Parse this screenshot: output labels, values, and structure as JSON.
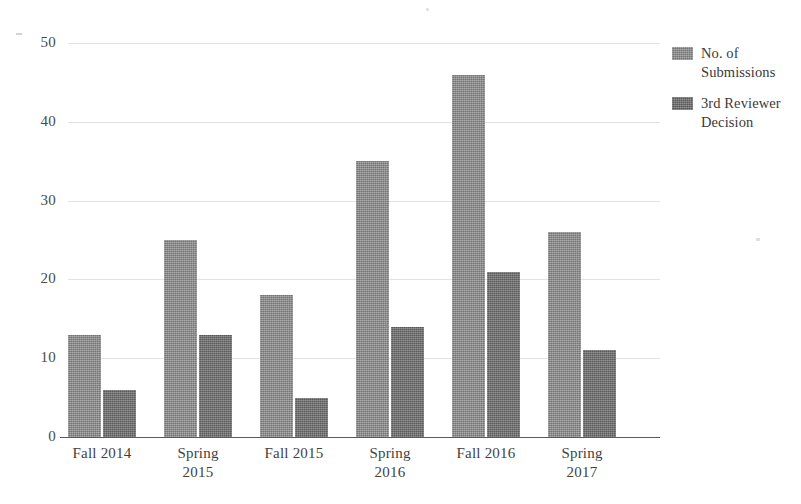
{
  "chart_data": {
    "type": "bar",
    "title": "",
    "subtitle": "",
    "xlabel": "",
    "ylabel": "",
    "categories": [
      "Fall 2014",
      "Spring\n2015",
      "Fall 2015",
      "Spring\n2016",
      "Fall 2016",
      "Spring\n2017"
    ],
    "series": [
      {
        "name": "No. of\nSubmissions",
        "values": [
          13,
          25,
          18,
          35,
          46,
          26
        ],
        "color": "#8d8d8d"
      },
      {
        "name": "3rd Reviewer\nDecision",
        "values": [
          6,
          13,
          5,
          14,
          21,
          11
        ],
        "color": "#6f6f6f"
      }
    ],
    "ylim": [
      0,
      50
    ],
    "ytick_labels": [
      "0",
      "10",
      "20",
      "30",
      "40",
      "50"
    ],
    "ytick_values": [
      0,
      10,
      20,
      30,
      40,
      50
    ],
    "grid": "horizontal",
    "legend_position": "right",
    "annotations": []
  },
  "axes": {
    "y_ticks": [
      {
        "label": "50",
        "value": 50
      },
      {
        "label": "40",
        "value": 40
      },
      {
        "label": "30",
        "value": 30
      },
      {
        "label": "20",
        "value": 20
      },
      {
        "label": "10",
        "value": 10
      },
      {
        "label": "0",
        "value": 0
      }
    ],
    "x_ticks": [
      {
        "label": "Fall 2014"
      },
      {
        "label": "Spring\n2015"
      },
      {
        "label": "Fall 2015"
      },
      {
        "label": "Spring\n2016"
      },
      {
        "label": "Fall 2016"
      },
      {
        "label": "Spring\n2017"
      }
    ]
  },
  "legend": {
    "items": [
      {
        "label": "No. of\nSubmissions",
        "swatch": "series-a-swatch"
      },
      {
        "label": "3rd Reviewer\nDecision",
        "swatch": "series-b-swatch"
      }
    ]
  },
  "colors": {
    "series_a": "#8d8d8d",
    "series_b": "#6f6f6f",
    "gridline": "#e2e2e2",
    "axis": "#5a5a5a",
    "text": "#3a3a3a",
    "background": "#ffffff"
  }
}
